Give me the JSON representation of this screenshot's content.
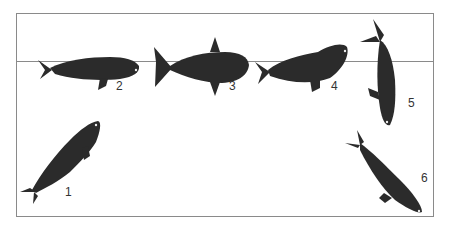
{
  "figure": {
    "colors": {
      "whale": "#2b2b2b",
      "frame": "#8a8a8a",
      "waterline": "#8a8a8a",
      "label": "#333333"
    },
    "labels": [
      {
        "id": 1,
        "text": "1",
        "x": 65,
        "y": 191
      },
      {
        "id": 2,
        "text": "2",
        "x": 116,
        "y": 85
      },
      {
        "id": 3,
        "text": "3",
        "x": 229,
        "y": 85
      },
      {
        "id": 4,
        "text": "4",
        "x": 331,
        "y": 85
      },
      {
        "id": 5,
        "text": "5",
        "x": 408,
        "y": 102
      },
      {
        "id": 6,
        "text": "6",
        "x": 421,
        "y": 177
      }
    ]
  }
}
